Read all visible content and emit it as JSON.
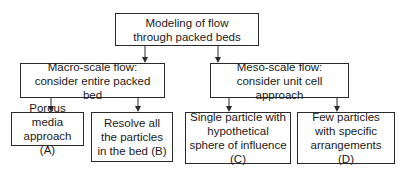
{
  "diagram": {
    "type": "hierarchy",
    "root": {
      "id": "root",
      "label": "Modeling of flow through packed beds"
    },
    "level1": [
      {
        "id": "macro",
        "label": "Macro-scale flow: consider entire packed bed"
      },
      {
        "id": "meso",
        "label": "Meso-scale flow: consider unit cell approach"
      }
    ],
    "level2": [
      {
        "id": "A",
        "parent": "macro",
        "label": "Porous media approach (A)"
      },
      {
        "id": "B",
        "parent": "macro",
        "label": "Resolve all the particles in the bed (B)"
      },
      {
        "id": "C",
        "parent": "meso",
        "label": "Single particle with hypothetical sphere of influence (C)"
      },
      {
        "id": "D",
        "parent": "meso",
        "label": "Few particles with specific arrangements (D)"
      }
    ],
    "edges": [
      [
        "root",
        "macro"
      ],
      [
        "root",
        "meso"
      ],
      [
        "macro",
        "A"
      ],
      [
        "macro",
        "B"
      ],
      [
        "meso",
        "C"
      ],
      [
        "meso",
        "D"
      ]
    ],
    "colors": {
      "line": "#2a2a2a",
      "box_fill": "#ffffff",
      "text": "#1a1a1a"
    }
  }
}
